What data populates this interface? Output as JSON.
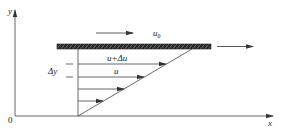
{
  "diagram": {
    "type": "couette-flow-velocity-profile",
    "colors": {
      "line": "#444444",
      "plate_fill": "#2a2a2a",
      "text": "#222222",
      "background": "#ffffff"
    },
    "axes": {
      "x_label": "x",
      "y_label": "y",
      "origin_label": "0"
    },
    "plate": {
      "velocity_label": "u",
      "velocity_subscript": "0"
    },
    "profile": {
      "upper_arrow_label": "u+Δu",
      "lower_arrow_label": "u",
      "spacing_label": "Δy",
      "arrow_count": 4
    }
  }
}
